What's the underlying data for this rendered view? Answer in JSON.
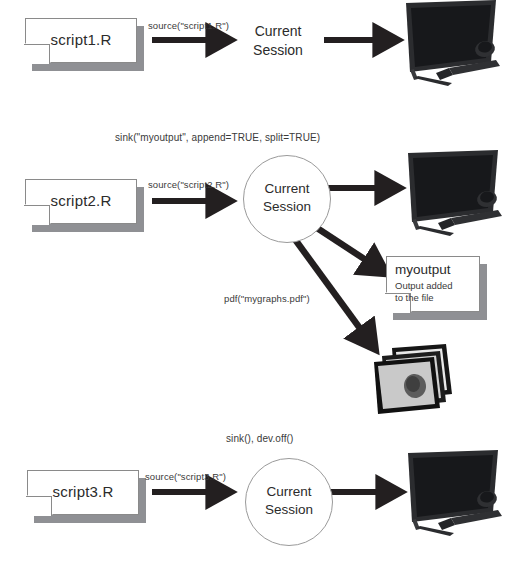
{
  "diagram": {
    "colors": {
      "arrow": "#231f20",
      "doc_shadow": "#8f9094",
      "doc_border": "#8a8a8a",
      "circle_border": "#9a9a9a",
      "text": "#2b2b2b",
      "monitor_body": "#2f3033",
      "monitor_screen": "#1b1c1f",
      "paper_gray": "#d9d9d9"
    },
    "rows": [
      {
        "id": "row-1",
        "script": {
          "label": "script1.R"
        },
        "source_call": "source(\"script1.R\")",
        "session": {
          "label": "Current\nSession",
          "circled": false
        },
        "output_device": "monitor-icon"
      },
      {
        "id": "row-2",
        "top_call": "sink(\"myoutput\", append=TRUE, split=TRUE)",
        "script": {
          "label": "script2.R"
        },
        "source_call": "source(\"script2.R\")",
        "session": {
          "label": "Current\nSession",
          "circled": true
        },
        "output_device": "monitor-icon",
        "file_output": {
          "title": "myoutput",
          "lines": [
            "Output added",
            "to the file"
          ]
        },
        "pdf_call": "pdf(\"mygraphs.pdf\")",
        "graphics_output": "graphs-stack-icon"
      },
      {
        "id": "row-3",
        "top_call": "sink(), dev.off()",
        "script": {
          "label": "script3.R"
        },
        "source_call": "source(\"script3.R\")",
        "session": {
          "label": "Current\nSession",
          "circled": true
        },
        "output_device": "monitor-icon"
      }
    ]
  }
}
